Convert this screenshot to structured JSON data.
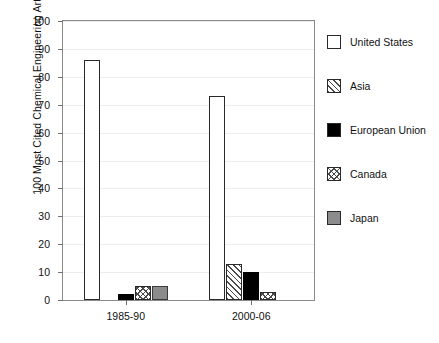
{
  "chart_data": {
    "type": "bar",
    "title": "",
    "subtitle": "",
    "xlabel": "",
    "ylabel": "100 Most Cited Chemical Engineering Articles",
    "categories": [
      "1985-90",
      "2000-06"
    ],
    "series": [
      {
        "name": "United States",
        "values": [
          86,
          73
        ],
        "fill": "empty",
        "color": "#ffffff"
      },
      {
        "name": "Asia",
        "values": [
          0,
          13
        ],
        "fill": "hatch",
        "color": "#ffffff"
      },
      {
        "name": "European Union",
        "values": [
          2,
          10
        ],
        "fill": "solid",
        "color": "#000000"
      },
      {
        "name": "Canada",
        "values": [
          5,
          3
        ],
        "fill": "crosshatch",
        "color": "#ffffff"
      },
      {
        "name": "Japan",
        "values": [
          5,
          0
        ],
        "fill": "solid",
        "color": "#8c8c8c"
      }
    ],
    "ylim": [
      0,
      100
    ],
    "yticks": [
      0,
      10,
      20,
      30,
      40,
      50,
      60,
      70,
      80,
      90,
      100
    ],
    "ytick_labels": [
      "0",
      "10",
      "20",
      "30",
      "40",
      "50",
      "60",
      "70",
      "80",
      "90",
      "100"
    ],
    "grid": true,
    "grid_axis": "y",
    "legend_position": "right"
  },
  "legend": {
    "items": [
      {
        "label": "United States",
        "swatch": "swatch-empty-icon"
      },
      {
        "label": "Asia",
        "swatch": "swatch-hatch-icon"
      },
      {
        "label": "European Union",
        "swatch": "swatch-solid-black-icon"
      },
      {
        "label": "Canada",
        "swatch": "swatch-crosshatch-icon"
      },
      {
        "label": "Japan",
        "swatch": "swatch-solid-gray-icon"
      }
    ]
  }
}
